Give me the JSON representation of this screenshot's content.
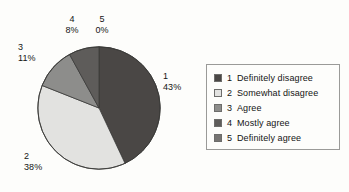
{
  "chart_data": {
    "type": "pie",
    "title": "",
    "categories": [
      "1",
      "2",
      "3",
      "4",
      "5"
    ],
    "values": [
      43,
      38,
      11,
      8,
      0
    ],
    "value_unit": "%",
    "start_angle_deg": 0,
    "direction": "clockwise",
    "legend_position": "right",
    "grid": false,
    "slices": [
      {
        "key": "1",
        "percent_label": "43%",
        "value": 43,
        "legend_label": "Definitely disagree",
        "color": "#4a4745"
      },
      {
        "key": "2",
        "percent_label": "38%",
        "value": 38,
        "legend_label": "Somewhat disagree",
        "color": "#e2e2e0"
      },
      {
        "key": "3",
        "percent_label": "11%",
        "value": 11,
        "legend_label": "Agree",
        "color": "#8d8d8b"
      },
      {
        "key": "4",
        "percent_label": "8%",
        "value": 8,
        "legend_label": "Mostly agree",
        "color": "#5e5c5a"
      },
      {
        "key": "5",
        "percent_label": "0%",
        "value": 0,
        "legend_label": "Definitely agree",
        "color": "#767472"
      }
    ]
  },
  "pie": {
    "labels": [
      {
        "name": "1",
        "percent": "43%"
      },
      {
        "name": "2",
        "percent": "38%"
      },
      {
        "name": "3",
        "percent": "11%"
      },
      {
        "name": "4",
        "percent": "8%"
      },
      {
        "name": "5",
        "percent": "0%"
      }
    ]
  },
  "legend": {
    "rows": [
      {
        "key": "1",
        "label": "Definitely disagree",
        "color": "#4a4745"
      },
      {
        "key": "2",
        "label": "Somewhat disagree",
        "color": "#e2e2e0"
      },
      {
        "key": "3",
        "label": "Agree",
        "color": "#8d8d8b"
      },
      {
        "key": "4",
        "label": "Mostly agree",
        "color": "#5e5c5a"
      },
      {
        "key": "5",
        "label": "Definitely agree",
        "color": "#767472"
      }
    ]
  }
}
